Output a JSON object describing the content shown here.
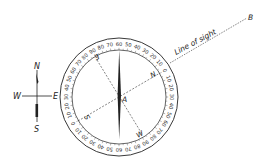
{
  "diagram": {
    "colors": {
      "ink": "#222222",
      "background": "#ffffff"
    },
    "rose": {
      "n": "N",
      "s": "S",
      "e": "E",
      "w": "W"
    },
    "dial": {
      "inner_letters": {
        "n": "N",
        "e": "E",
        "s": "S",
        "w": "W"
      },
      "center_label": "A",
      "north_offset_deg": 60,
      "ring_labels": [
        "60",
        "50",
        "40",
        "30",
        "20",
        "10",
        "0",
        "10",
        "20",
        "30",
        "40",
        "50",
        "60",
        "70",
        "80",
        "90",
        "80",
        "70",
        "60",
        "50",
        "40",
        "30",
        "20",
        "10",
        "0",
        "10",
        "20",
        "30",
        "40",
        "50",
        "60",
        "70",
        "80",
        "90",
        "80",
        "70"
      ]
    },
    "line_of_sight": {
      "label": "Line of sight",
      "end_label": "B"
    }
  }
}
